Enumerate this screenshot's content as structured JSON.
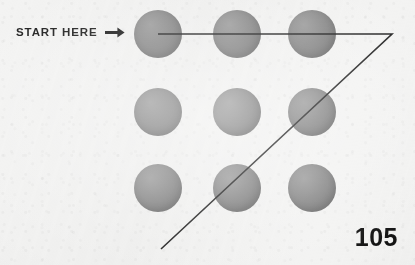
{
  "page": {
    "width": 415,
    "height": 265,
    "background_color": "#f3f3f2",
    "page_number": "105"
  },
  "annotation": {
    "start_label": "START HERE",
    "arrow_icon": "arrow-right-icon",
    "arrow_color": "#1c1c1c"
  },
  "puzzle": {
    "name": "nine-dots-puzzle",
    "dot_color": "#848484",
    "dot_radius": 24,
    "rows": 3,
    "columns": 3,
    "dots": [
      {
        "id": "dot-r1c1",
        "row": 1,
        "col": 1,
        "cx": 158,
        "cy": 34
      },
      {
        "id": "dot-r1c2",
        "row": 1,
        "col": 2,
        "cx": 237,
        "cy": 34
      },
      {
        "id": "dot-r1c3",
        "row": 1,
        "col": 3,
        "cx": 312,
        "cy": 34
      },
      {
        "id": "dot-r2c1",
        "row": 2,
        "col": 1,
        "cx": 158,
        "cy": 112
      },
      {
        "id": "dot-r2c2",
        "row": 2,
        "col": 2,
        "cx": 237,
        "cy": 112
      },
      {
        "id": "dot-r2c3",
        "row": 2,
        "col": 3,
        "cx": 312,
        "cy": 112
      },
      {
        "id": "dot-r3c1",
        "row": 3,
        "col": 1,
        "cx": 158,
        "cy": 188
      },
      {
        "id": "dot-r3c2",
        "row": 3,
        "col": 2,
        "cx": 237,
        "cy": 188
      },
      {
        "id": "dot-r3c3",
        "row": 3,
        "col": 3,
        "cx": 312,
        "cy": 188
      }
    ],
    "solution_path": {
      "stroke_color": "#232323",
      "stroke_width": 1.6,
      "points": [
        {
          "x": 158,
          "y": 34
        },
        {
          "x": 392,
          "y": 34
        },
        {
          "x": 161,
          "y": 249
        }
      ]
    }
  }
}
